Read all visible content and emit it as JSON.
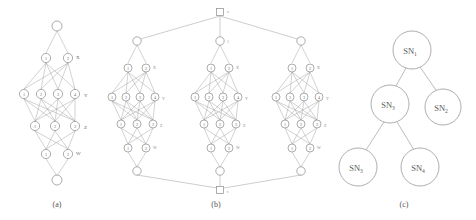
{
  "figure": {
    "panels": [
      {
        "id": "a",
        "caption": "(a)",
        "caption_x": 57,
        "caption_y": 207,
        "type": "layered-network",
        "description": "Single layered network with source node, layers X, Y, Z, W and sink node",
        "layers": [
          {
            "name": "source",
            "label": "",
            "nodes": [
              ""
            ],
            "y": 26,
            "xs": [
              57
            ]
          },
          {
            "name": "X",
            "label": "X",
            "nodes": [
              "1",
              "2"
            ],
            "y": 58,
            "xs": [
              46,
              68
            ]
          },
          {
            "name": "Y",
            "label": "Y",
            "nodes": [
              "1",
              "2",
              "3",
              "4"
            ],
            "y": 94,
            "xs": [
              24,
              41,
              58,
              75
            ]
          },
          {
            "name": "Z",
            "label": "Z",
            "nodes": [
              "1",
              "2",
              "3"
            ],
            "y": 126,
            "xs": [
              35,
              55,
              75
            ]
          },
          {
            "name": "W",
            "label": "W",
            "nodes": [
              "1",
              "2"
            ],
            "y": 154,
            "xs": [
              46,
              68
            ]
          },
          {
            "name": "sink",
            "label": "",
            "nodes": [
              ""
            ],
            "y": 180,
            "xs": [
              57
            ]
          }
        ]
      },
      {
        "id": "b",
        "caption": "(b)",
        "caption_x": 216,
        "caption_y": 207,
        "type": "composite-network",
        "description": "Three copies of the panel (a) subnetwork wired between a top source node s and a bottom sink node t",
        "source_node_label": "s",
        "sink_node_label": "t",
        "subnet_count": 3,
        "layer_labels": [
          "X",
          "Y",
          "Z",
          "W"
        ]
      },
      {
        "id": "c",
        "caption": "(c)",
        "caption_x": 404,
        "caption_y": 207,
        "type": "tree",
        "description": "Hierarchy tree of service nodes",
        "nodes": [
          {
            "id": "sn1",
            "label": "SN",
            "sub": "1",
            "cx": 412,
            "cy": 50,
            "r": 19
          },
          {
            "id": "sn5",
            "label": "SN",
            "sub": "3",
            "cx": 390,
            "cy": 104,
            "r": 19
          },
          {
            "id": "sn2",
            "label": "SN",
            "sub": "2",
            "cx": 443,
            "cy": 107,
            "r": 18
          },
          {
            "id": "sn3",
            "label": "SN",
            "sub": "3",
            "cx": 358,
            "cy": 167,
            "r": 19
          },
          {
            "id": "sn4",
            "label": "SN",
            "sub": "4",
            "cx": 420,
            "cy": 167,
            "r": 19
          }
        ],
        "edges": [
          {
            "from": "sn1",
            "to": "sn5"
          },
          {
            "from": "sn1",
            "to": "sn2"
          },
          {
            "from": "sn5",
            "to": "sn3"
          },
          {
            "from": "sn5",
            "to": "sn4"
          }
        ]
      }
    ]
  },
  "colors": {
    "background": "#ffffff",
    "stroke": "#8a8a8a",
    "edge": "#9a9a9a",
    "text": "#5a5a5a"
  }
}
